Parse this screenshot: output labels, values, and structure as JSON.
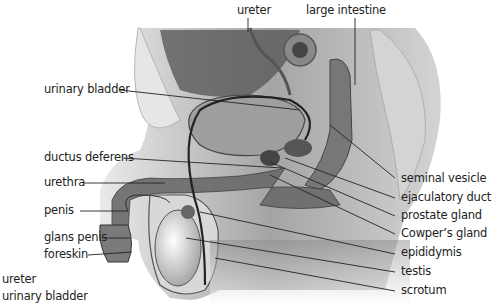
{
  "diagram": {
    "type": "anatomical cross-section",
    "labels_top": [
      {
        "id": "ureter",
        "text": "ureter"
      },
      {
        "id": "large-intestine",
        "text": "large intestine"
      }
    ],
    "labels_left": [
      {
        "id": "urinary-bladder",
        "text": "urinary bladder"
      },
      {
        "id": "ductus-deferens",
        "text": "ductus deferens"
      },
      {
        "id": "urethra",
        "text": "urethra"
      },
      {
        "id": "penis",
        "text": "penis"
      },
      {
        "id": "glans-penis",
        "text": "glans penis"
      },
      {
        "id": "foreskin",
        "text": "foreskin"
      }
    ],
    "labels_right": [
      {
        "id": "seminal-vesicle",
        "text": "seminal vesicle"
      },
      {
        "id": "ejaculatory-duct",
        "text": "ejaculatory duct"
      },
      {
        "id": "prostate-gland",
        "text": "prostate gland"
      },
      {
        "id": "cowpers-gland",
        "text": "Cowper’s gland"
      },
      {
        "id": "epididymis",
        "text": "epididymis"
      },
      {
        "id": "testis",
        "text": "testis"
      },
      {
        "id": "scrotum",
        "text": "scrotum"
      }
    ],
    "labels_stray": [
      {
        "id": "ureter-stray",
        "text": "ureter"
      },
      {
        "id": "urinary-bladder-stray",
        "text": "urinary bladder"
      }
    ]
  }
}
